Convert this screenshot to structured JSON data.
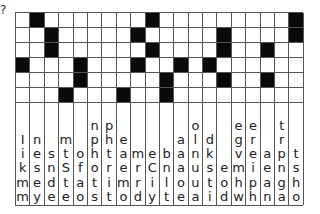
{
  "corner_glyph": "?",
  "grid": {
    "rows": 6,
    "cols": 20,
    "colors": {
      "black": "#0a0a0a",
      "white": "#ffffff",
      "line": "#555555"
    },
    "black_cells": [
      [
        2,
        10,
        20
      ],
      [
        3,
        9,
        15,
        20
      ],
      [
        3,
        10,
        15,
        18
      ],
      [
        1,
        5,
        9,
        12,
        14
      ],
      [
        5,
        11,
        15,
        18
      ],
      [
        4,
        8,
        11
      ]
    ]
  },
  "letter_columns": [
    [
      "I",
      "i",
      "k",
      "m",
      "m"
    ],
    [
      "n",
      "e",
      "s",
      "e",
      "y"
    ],
    [
      "s",
      "n",
      "d",
      "e"
    ],
    [
      "m",
      "t",
      "S",
      "t",
      "e"
    ],
    [
      "o",
      "f",
      "a",
      "o"
    ],
    [
      "n",
      "p",
      "h",
      "o",
      "t",
      "s"
    ],
    [
      "p",
      "h",
      "t",
      "r",
      "i",
      "t"
    ],
    [
      "e",
      "a",
      "e",
      "m",
      "o"
    ],
    [
      "m",
      "r",
      "r",
      "d"
    ],
    [
      "e",
      "C",
      "i",
      "y"
    ],
    [
      "b",
      "n",
      "l",
      "t"
    ],
    [
      "a",
      "a",
      "a",
      "o",
      "e"
    ],
    [
      "o",
      "l",
      "n",
      "u",
      "u",
      "a"
    ],
    [
      "d",
      "k",
      "s",
      "t",
      "i"
    ],
    [
      "e",
      "o",
      "d"
    ],
    [
      "e",
      "g",
      "v",
      "m",
      "h",
      "w"
    ],
    [
      "e",
      "r",
      "e",
      "i",
      "p",
      "h"
    ],
    [
      "a",
      "e",
      "a",
      "n"
    ],
    [
      "t",
      "r",
      "p",
      "n",
      "g",
      "a"
    ],
    [
      "t",
      "s",
      "h",
      "o"
    ]
  ]
}
